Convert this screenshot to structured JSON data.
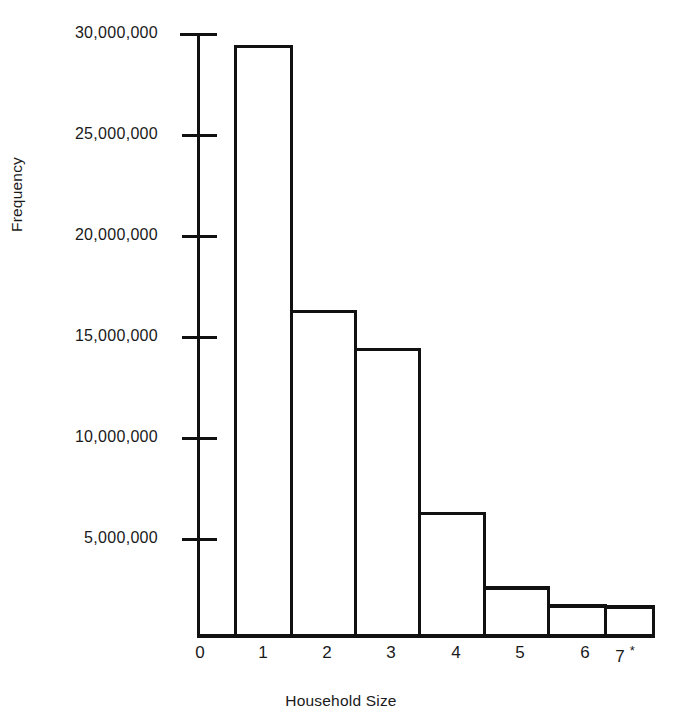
{
  "chart_data": {
    "type": "bar",
    "title": "",
    "xlabel": "Household Size",
    "ylabel": "Frequency",
    "categories": [
      "1",
      "2",
      "3",
      "4",
      "5",
      "6",
      "7"
    ],
    "values": [
      22000000,
      29400000,
      16200000,
      14300000,
      6100000,
      2400000,
      1500000
    ],
    "xlim": [
      0,
      7.5
    ],
    "ylim": [
      0,
      30000000
    ],
    "x_tick_labels": [
      "0",
      "1",
      "2",
      "3",
      "4",
      "5",
      "6",
      "7"
    ],
    "x_last_tick_suffix": "*",
    "y_tick_labels": [
      "30,000,000",
      "25,000,000",
      "20,000,000",
      "15,000,000",
      "10,000,000",
      "5,000,000"
    ],
    "y_tick_values": [
      30000000,
      25000000,
      20000000,
      15000000,
      10000000,
      5000000
    ],
    "grid": false,
    "legend": "none",
    "bar_style": "outlined",
    "bar_fill": "#ffffff",
    "bar_stroke": "#111111",
    "axis_color": "#111111"
  },
  "axes": {
    "y_title": "Frequency",
    "x_title": "Household Size"
  }
}
